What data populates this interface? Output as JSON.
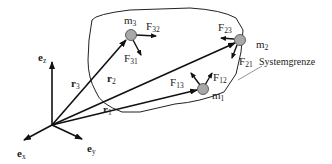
{
  "diagram": {
    "boundary_label": "Systemgrenze",
    "basis": {
      "ez": {
        "base": "e",
        "sub": "z"
      },
      "ex": {
        "base": "e",
        "sub": "x"
      },
      "ey": {
        "base": "e",
        "sub": "y"
      }
    },
    "position_vectors": {
      "r1": {
        "base": "r",
        "sub": "1"
      },
      "r2": {
        "base": "r",
        "sub": "2"
      },
      "r3": {
        "base": "r",
        "sub": "3"
      }
    },
    "masses": {
      "m1": {
        "base": "m",
        "sub": "1"
      },
      "m2": {
        "base": "m",
        "sub": "2"
      },
      "m3": {
        "base": "m",
        "sub": "3"
      }
    },
    "forces": {
      "F12": {
        "base": "F",
        "sub": "12"
      },
      "F13": {
        "base": "F",
        "sub": "13"
      },
      "F21": {
        "base": "F",
        "sub": "21"
      },
      "F23": {
        "base": "F",
        "sub": "23"
      },
      "F31": {
        "base": "F",
        "sub": "31"
      },
      "F32": {
        "base": "F",
        "sub": "32"
      }
    },
    "colors": {
      "line": "#111111",
      "mass_fill": "#a8a8a8",
      "leader": "#777777"
    }
  }
}
